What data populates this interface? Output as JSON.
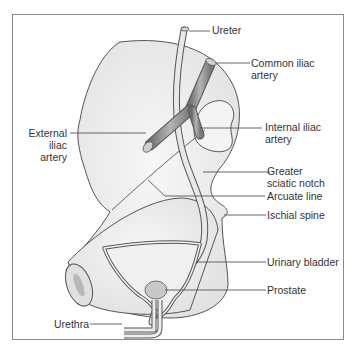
{
  "diagram": {
    "type": "anatomical-illustration",
    "colors": {
      "frame": "#8a8a8a",
      "bone_fill": "#ededed",
      "outline": "#555555",
      "leader": "#555555",
      "text": "#333333",
      "artery_fill": "#9a9a9a",
      "prostate_fill": "#c8c8c8"
    },
    "labels": {
      "ureter": "Ureter",
      "common_iliac_artery": "Common iliac\nartery",
      "external_iliac_artery": "External\niliac\nartery",
      "internal_iliac_artery": "Internal iliac\nartery",
      "greater_sciatic_notch": "Greater\nsciatic notch",
      "arcuate_line": "Arcuate line",
      "ischial_spine": "Ischial spine",
      "urinary_bladder": "Urinary bladder",
      "prostate": "Prostate",
      "urethra": "Urethra"
    }
  }
}
